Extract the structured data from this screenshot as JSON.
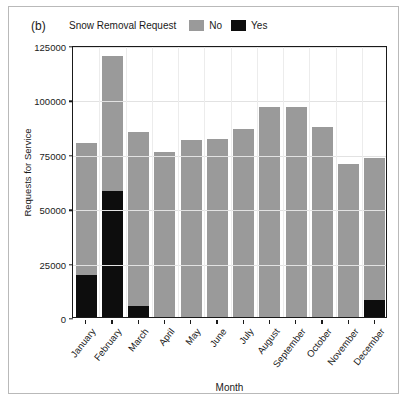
{
  "figure": {
    "panel_label": "(b)"
  },
  "legend": {
    "title": "Snow Removal Request",
    "items": [
      {
        "label": "No",
        "color": "#9a9a9a",
        "swatch_name": "legend-swatch-no"
      },
      {
        "label": "Yes",
        "color": "#0d0d0d",
        "swatch_name": "legend-swatch-yes"
      }
    ]
  },
  "axes": {
    "y_title": "Requests for Service",
    "x_title": "Month",
    "y_ticks": [
      "0",
      "25000",
      "50000",
      "75000",
      "100000",
      "125000"
    ]
  },
  "chart_data": {
    "type": "bar",
    "title": "",
    "subtitle": "",
    "xlabel": "Month",
    "ylabel": "Requests for Service",
    "ylim": [
      0,
      125000
    ],
    "ytick_values": [
      0,
      25000,
      50000,
      75000,
      100000,
      125000
    ],
    "grid": true,
    "stacked": true,
    "legend_title": "Snow Removal Request",
    "legend_position": "top",
    "categories": [
      "January",
      "February",
      "March",
      "April",
      "May",
      "June",
      "July",
      "August",
      "September",
      "October",
      "November",
      "December"
    ],
    "series": [
      {
        "name": "Yes",
        "color": "#0d0d0d",
        "values": [
          19500,
          58000,
          5000,
          0,
          0,
          0,
          0,
          0,
          0,
          0,
          0,
          8000
        ]
      },
      {
        "name": "No",
        "color": "#9a9a9a",
        "values": [
          60500,
          62000,
          80000,
          76000,
          81500,
          82000,
          86500,
          96500,
          96500,
          87500,
          70500,
          65000
        ]
      }
    ],
    "totals": [
      80000,
      120000,
      85000,
      76000,
      81500,
      82000,
      86500,
      96500,
      96500,
      87500,
      70500,
      73000
    ]
  }
}
